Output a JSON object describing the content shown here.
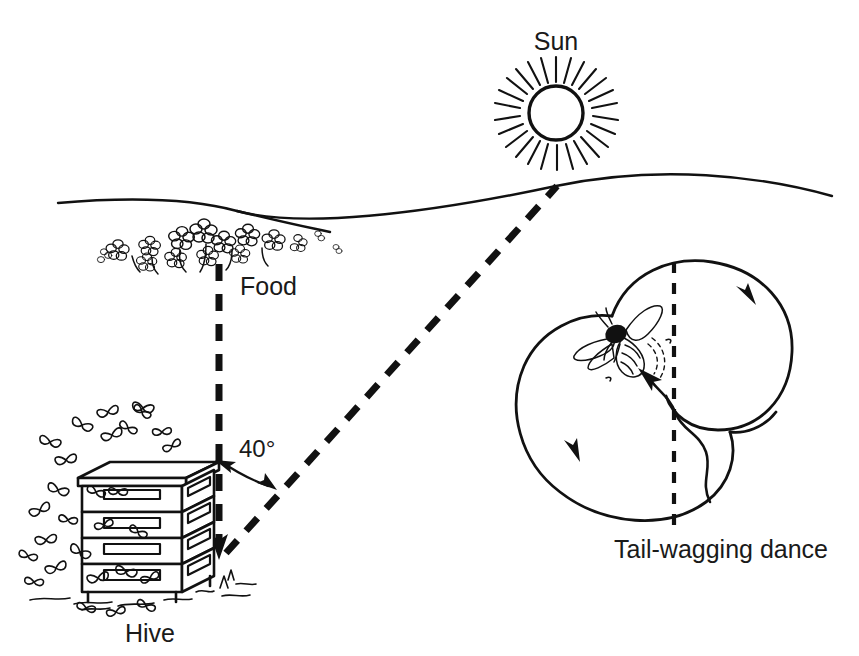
{
  "figure": {
    "background_color": "#ffffff",
    "ink_color": "#111111",
    "width": 859,
    "height": 656
  },
  "labels": {
    "sun": "Sun",
    "food": "Food",
    "hive": "Hive",
    "angle": "40°",
    "dance": "Tail-wagging dance"
  },
  "elements": {
    "sun_icon": "sun-icon",
    "horizon": "horizon-line",
    "flowers": "flower-cluster",
    "hive_stack": "beehive-stack",
    "bee_swarm": "bee-swarm",
    "dancing_bee": "dancing-bee",
    "figure_eight": "figure-eight-path",
    "waggle_run": "waggle-run-arrow",
    "reference_line": "vertical-dashed-reference-line",
    "line_to_food": "dashed-line-hive-to-food",
    "line_to_sun": "dashed-line-hive-to-sun",
    "angle_arc": "angle-arc-40-degrees"
  },
  "geometry": {
    "sun_center": [
      556,
      112
    ],
    "sun_radius": 26,
    "hive_apex": [
      219,
      558
    ],
    "food_point": [
      219,
      262
    ],
    "sun_horizon_point": [
      557,
      186
    ],
    "angle_degrees": 40,
    "dance_center": [
      674,
      395
    ]
  }
}
